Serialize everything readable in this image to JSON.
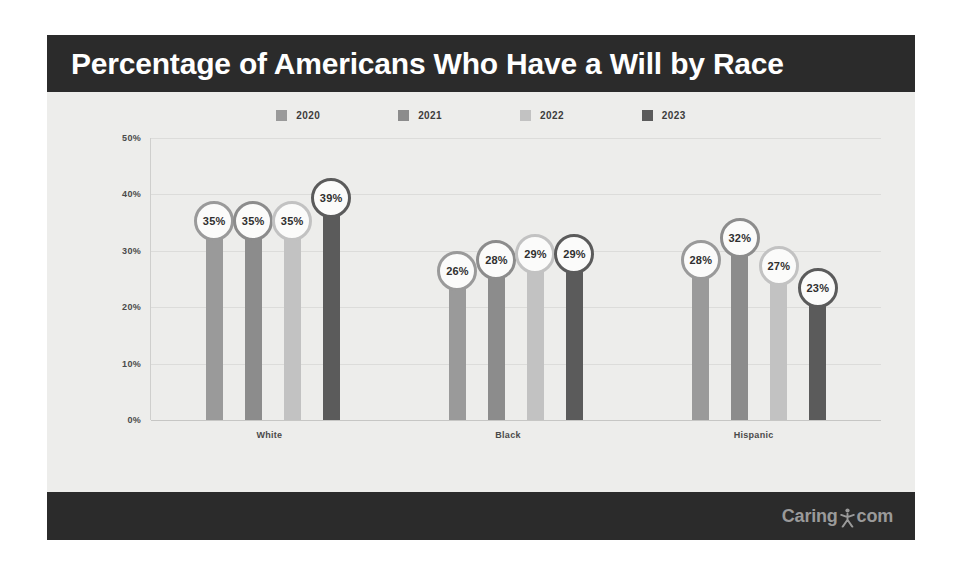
{
  "header": {
    "title": "Percentage of Americans Who Have a Will by Race"
  },
  "footer": {
    "brand_prefix": "Caring",
    "brand_suffix": "com",
    "brand_mark_name": "person-logo-icon"
  },
  "colors": {
    "header_band": "#2b2b2b",
    "footer_band": "#2b2b2b",
    "card_background": "#eeeeec",
    "plot_background": "#ededeb",
    "gridline": "#dcdcda",
    "series_2020": "#9a9a9a",
    "series_2021": "#8c8c8c",
    "series_2022": "#c2c2c2",
    "series_2023": "#5b5b5b"
  },
  "chart_data": {
    "type": "bar",
    "title": "Percentage of Americans Who Have a Will by Race",
    "xlabel": "",
    "ylabel": "",
    "categories": [
      "White",
      "Black",
      "Hispanic"
    ],
    "series": [
      {
        "name": "2020",
        "color": "#9a9a9a",
        "values": [
          35,
          26,
          28
        ],
        "labels": [
          "35%",
          "26%",
          "28%"
        ]
      },
      {
        "name": "2021",
        "color": "#8c8c8c",
        "values": [
          35,
          28,
          32
        ],
        "labels": [
          "35%",
          "28%",
          "32%"
        ]
      },
      {
        "name": "2022",
        "color": "#c2c2c2",
        "values": [
          35,
          29,
          27
        ],
        "labels": [
          "35%",
          "29%",
          "27%"
        ]
      },
      {
        "name": "2023",
        "color": "#5b5b5b",
        "values": [
          39,
          29,
          23
        ],
        "labels": [
          "39%",
          "29%",
          "23%"
        ]
      }
    ],
    "ylim": [
      0,
      50
    ],
    "yticks": [
      0,
      10,
      20,
      30,
      40,
      50
    ],
    "ytick_labels": [
      "0%",
      "10%",
      "20%",
      "30%",
      "40%",
      "50%"
    ],
    "grid": true,
    "legend_position": "top-center",
    "value_label_style": "circle-bubble"
  }
}
